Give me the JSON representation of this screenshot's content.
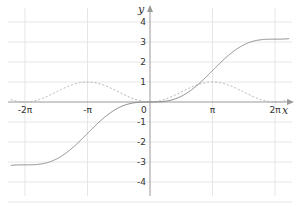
{
  "chart_data": {
    "type": "line",
    "title": "",
    "xlabel": "x",
    "ylabel": "y",
    "x_ticks": [
      {
        "label": "-2π",
        "value": -6.2832
      },
      {
        "label": "-π",
        "value": -3.1416
      },
      {
        "label": "0",
        "value": 0
      },
      {
        "label": "π",
        "value": 3.1416
      },
      {
        "label": "2π",
        "value": 6.2832
      }
    ],
    "y_ticks": [
      {
        "label": "4",
        "value": 4
      },
      {
        "label": "3",
        "value": 3
      },
      {
        "label": "2",
        "value": 2
      },
      {
        "label": "1",
        "value": 1
      },
      {
        "label": "-1",
        "value": -1
      },
      {
        "label": "-2",
        "value": -2
      },
      {
        "label": "-3",
        "value": -3
      },
      {
        "label": "-4",
        "value": -4
      }
    ],
    "xlim": [
      -7.0,
      7.0
    ],
    "ylim": [
      -4.7,
      5.1
    ],
    "grid": true,
    "legend": null,
    "series": [
      {
        "name": "y = (x - sin x)/2",
        "style": "solid",
        "color": "#888888",
        "x": [
          -7.0,
          -6.2832,
          -5.4978,
          -4.7124,
          -3.927,
          -3.1416,
          -2.3562,
          -1.5708,
          -0.7854,
          0,
          0.7854,
          1.5708,
          2.3562,
          3.1416,
          3.927,
          4.7124,
          5.4978,
          6.2832,
          7.0
        ],
        "y": [
          -3.17,
          -3.14,
          -2.4,
          -1.86,
          -1.61,
          -1.57,
          -1.53,
          -0.29,
          -0.04,
          0,
          0.04,
          0.29,
          0.82,
          1.57,
          2.32,
          2.86,
          3.1,
          3.14,
          3.17
        ]
      },
      {
        "name": "y = (1 - cos x)/2",
        "style": "dashed",
        "color": "#aaaaaa",
        "x": [
          -7.0,
          -6.2832,
          -4.7124,
          -3.1416,
          -1.5708,
          0,
          1.5708,
          3.1416,
          4.7124,
          6.2832,
          7.0
        ],
        "y": [
          0.12,
          0,
          0.5,
          1,
          0.5,
          0,
          0.5,
          1,
          0.5,
          0,
          0.12
        ]
      }
    ]
  },
  "labels": {
    "x_axis": "x",
    "y_axis": "y",
    "origin": "0"
  },
  "colors": {
    "grid": "#e6e6e6",
    "axis": "#999999",
    "curve": "#8a8a8a",
    "dashed": "#b0b0b0",
    "text": "#333333"
  }
}
